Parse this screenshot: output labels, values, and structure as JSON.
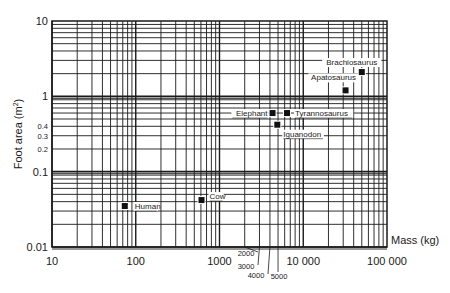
{
  "chart_data": {
    "type": "scatter",
    "title": "",
    "xlabel": "Mass (kg)",
    "ylabel": "Foot area (m2)",
    "xscale": "log",
    "yscale": "log",
    "xlim": [
      10,
      100000
    ],
    "ylim": [
      0.01,
      10
    ],
    "grid": true,
    "legend": null,
    "x_tick_labels": [
      "10",
      "100",
      "1000",
      "10 000",
      "100 000"
    ],
    "x_tick_values": [
      10,
      100,
      1000,
      10000,
      100000
    ],
    "x_minor_callouts": [
      "2000",
      "3000",
      "4000",
      "5000"
    ],
    "y_tick_labels": [
      "10",
      "1",
      "0.4",
      "0.3",
      "0.2",
      "0.1",
      "0.01"
    ],
    "y_tick_values": [
      10,
      1,
      0.4,
      0.3,
      0.2,
      0.1,
      0.01
    ],
    "points": [
      {
        "label": "Human",
        "mass": 74,
        "foot_area": 0.035
      },
      {
        "label": "Cow",
        "mass": 610,
        "foot_area": 0.042
      },
      {
        "label": "Elephant",
        "mass": 4300,
        "foot_area": 0.6
      },
      {
        "label": "Tyrannosaurus",
        "mass": 6400,
        "foot_area": 0.6
      },
      {
        "label": "Iguanodon",
        "mass": 4900,
        "foot_area": 0.42
      },
      {
        "label": "Apatosaurus",
        "mass": 32000,
        "foot_area": 1.2
      },
      {
        "label": "Brachiosaurus",
        "mass": 50000,
        "foot_area": 2.1
      }
    ]
  },
  "axes": {
    "ylabel_main": "Foot area (m",
    "ylabel_sup": "2",
    "ylabel_close": ")",
    "xlabel": "Mass (kg)"
  }
}
